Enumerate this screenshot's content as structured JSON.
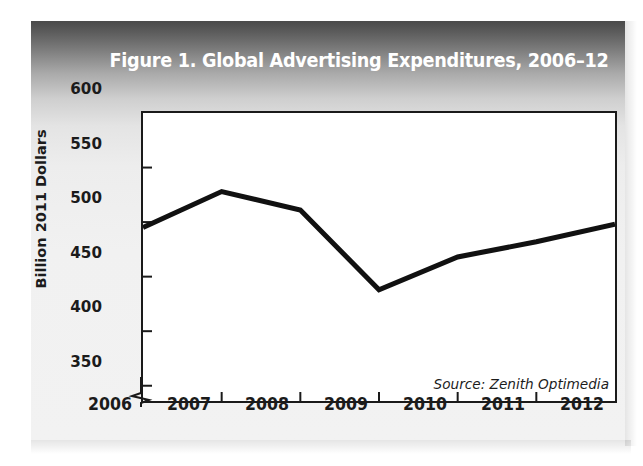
{
  "figure": {
    "title": "Figure 1. Global Advertising Expenditures, 2006–12",
    "source_note": "Source: Zenith Optimedia",
    "title_color": "#ffffff",
    "line_color": "#111111",
    "panel_background_top": "#4a4a4a",
    "panel_background_bottom": "#f2f2f2",
    "plot_background": "#ffffff",
    "axis_color": "#1a1a1a"
  },
  "chart_data": {
    "type": "line",
    "title": "Figure 1. Global Advertising Expenditures, 2006–12",
    "xlabel": "",
    "ylabel": "Billion 2011 Dollars",
    "x": [
      2006,
      2007,
      2008,
      2009,
      2010,
      2011,
      2012
    ],
    "xtick_labels": [
      "2006",
      "2007",
      "2008",
      "2009",
      "2010",
      "2011",
      "2012"
    ],
    "values": [
      495,
      528,
      511,
      438,
      468,
      482,
      498
    ],
    "ytick_labels": [
      "350",
      "400",
      "450",
      "500",
      "550",
      "600"
    ],
    "yticks": [
      350,
      400,
      450,
      500,
      550,
      600
    ],
    "ylim": [
      336,
      600
    ],
    "xlim": [
      2006,
      2012
    ],
    "y_axis_break": true,
    "grid": false,
    "legend": false,
    "annotations": [
      "Source: Zenith Optimedia"
    ],
    "series": [
      {
        "name": "Global Advertising Expenditures",
        "values": [
          495,
          528,
          511,
          438,
          468,
          482,
          498
        ]
      }
    ]
  }
}
